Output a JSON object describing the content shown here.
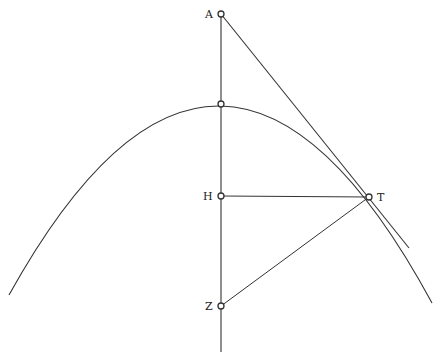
{
  "diagram": {
    "type": "geometric-construction",
    "colors": {
      "stroke": "#333333",
      "background": "#ffffff"
    },
    "points": {
      "A": {
        "label": "A",
        "x": 221,
        "y": 14
      },
      "vertex": {
        "label": "",
        "x": 221,
        "y": 104
      },
      "H": {
        "label": "H",
        "x": 221,
        "y": 196
      },
      "T": {
        "label": "T",
        "x": 369,
        "y": 197
      },
      "Z": {
        "label": "Z",
        "x": 221,
        "y": 306
      }
    },
    "labels": {
      "A": "A",
      "H": "H",
      "T": "T",
      "Z": "Z"
    },
    "segments": [
      {
        "name": "axis",
        "from": "A",
        "to": "axis-end"
      },
      {
        "name": "tangent",
        "from": "A",
        "to": "T-extended"
      },
      {
        "name": "ordinate",
        "from": "H",
        "to": "T"
      },
      {
        "name": "normal",
        "from": "Z",
        "to": "T"
      }
    ]
  }
}
